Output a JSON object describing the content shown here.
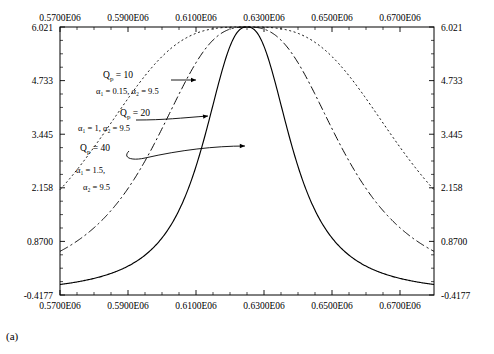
{
  "figure": {
    "caption": "(a)"
  },
  "chart_data": {
    "type": "line",
    "title": "",
    "xlabel": "",
    "ylabel": "",
    "xlim": [
      570000,
      680000
    ],
    "ylim": [
      -0.4177,
      6.021
    ],
    "grid": false,
    "axes": {
      "top_ticks": [
        "0.5700E06",
        "0.5900E06",
        "0.6100E06",
        "0.6300E06",
        "0.6500E06",
        "0.6700E06"
      ],
      "bottom_ticks": [
        "0.5700E06",
        "0.5900E06",
        "0.6100E06",
        "0.6300E06",
        "0.6500E06",
        "0.6700E06"
      ],
      "left_ticks": [
        "6.021",
        "4.733",
        "3.445",
        "2.158",
        "0.8700",
        "-0.4177"
      ],
      "right_ticks": [
        "6.021",
        "4.733",
        "3.445",
        "2.158",
        "0.8700",
        "-0.4177"
      ],
      "tick_values_x": [
        570000,
        590000,
        610000,
        630000,
        650000,
        670000
      ],
      "tick_values_y": [
        6.021,
        4.733,
        3.445,
        2.158,
        0.87,
        -0.4177
      ]
    },
    "series": [
      {
        "name": "Q_p = 10",
        "style": "dotted",
        "peak_x": 625000,
        "peak_y": 6.021,
        "half_width": 48000,
        "exponent": 1.6
      },
      {
        "name": "Q_p = 20",
        "style": "dash-dot",
        "peak_x": 625000,
        "peak_y": 6.021,
        "half_width": 30000,
        "exponent": 1.35
      },
      {
        "name": "Q_p = 40",
        "style": "solid",
        "peak_x": 625000,
        "peak_y": 6.021,
        "half_width": 14500,
        "exponent": 1.2
      }
    ],
    "annotations": [
      {
        "id": "annot-qp10",
        "line1": "Q",
        "line1_sub": "p",
        "line1_rest": " = 10",
        "line2": "α₁ = 0.15, α₂ = 9.5"
      },
      {
        "id": "annot-qp20",
        "line1": "Q",
        "line1_sub": "p",
        "line1_rest": " = 20",
        "line2": "α₁ = 1, α₂ = 9.5"
      },
      {
        "id": "annot-qp40",
        "line1": "Q",
        "line1_sub": "p",
        "line1_rest": " = 40",
        "line2": "α₁ = 1.5,",
        "line3": "α₂ = 9.5"
      }
    ]
  },
  "colors": {
    "axis": "#000000",
    "curve": "#000000",
    "background": "#ffffff"
  }
}
